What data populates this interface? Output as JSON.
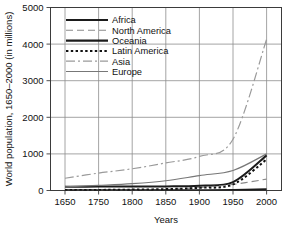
{
  "chart_data": {
    "type": "line",
    "title": "",
    "xlabel": "Years",
    "ylabel": "World population, 1650–2000 (in millions)",
    "x": [
      1650,
      1750,
      1800,
      1850,
      1900,
      1950,
      2000
    ],
    "xtick_labels": [
      "1650",
      "1750",
      "1800",
      "1850",
      "1900",
      "1950",
      "2000"
    ],
    "ytick_labels": [
      "0",
      "1000",
      "2000",
      "3000",
      "4000",
      "5000"
    ],
    "yticks": [
      0,
      1000,
      2000,
      3000,
      4000,
      5000
    ],
    "ylim": [
      0,
      5000
    ],
    "xlim": [
      1650,
      2050
    ],
    "grid": true,
    "legend_position": "upper-left-inside",
    "series": [
      {
        "name": "Africa",
        "style": "solid-thick",
        "color": "#1b1b1b",
        "width": 2.0,
        "dash": "",
        "values": [
          100,
          106,
          107,
          111,
          133,
          229,
          960
        ]
      },
      {
        "name": "North America",
        "style": "dashed",
        "color": "#8a8a8a",
        "width": 1.1,
        "dash": "7,4",
        "values": [
          5,
          6,
          7,
          26,
          82,
          166,
          310
        ]
      },
      {
        "name": "Oceania",
        "style": "solid-thick",
        "color": "#1b1b1b",
        "width": 2.2,
        "dash": "",
        "values": [
          2,
          2,
          2,
          2,
          6,
          13,
          30
        ]
      },
      {
        "name": "Latin America",
        "style": "dotted",
        "color": "#111111",
        "width": 2.0,
        "dash": "2.4,2.4",
        "values": [
          12,
          16,
          24,
          38,
          74,
          166,
          850
        ]
      },
      {
        "name": "Asia",
        "style": "dash-dot",
        "color": "#9a9a9a",
        "width": 1.2,
        "dash": "9,3,2,3",
        "values": [
          335,
          476,
          593,
          754,
          932,
          1402,
          4130
        ]
      },
      {
        "name": "Europe",
        "style": "solid-thin",
        "color": "#777777",
        "width": 1.2,
        "dash": "",
        "values": [
          100,
          140,
          187,
          266,
          408,
          547,
          1000
        ]
      }
    ]
  },
  "legend": {
    "entries": [
      {
        "label": "Africa"
      },
      {
        "label": "North America"
      },
      {
        "label": "Oceania"
      },
      {
        "label": "Latin America"
      },
      {
        "label": "Asia"
      },
      {
        "label": "Europe"
      }
    ]
  },
  "colors": {
    "frame": "#3b3b3b",
    "grid": "#8d8d8d",
    "background": "#ffffff",
    "text": "#111111"
  }
}
